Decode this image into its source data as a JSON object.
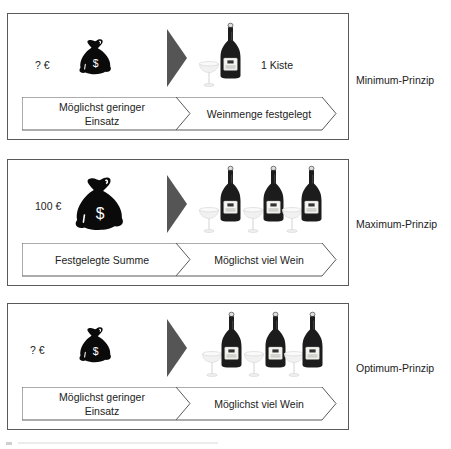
{
  "panels": [
    {
      "amount": "? €",
      "bag_size": "small",
      "bottle_count": 1,
      "quantity_label": "1 Kiste",
      "step1": "Möglichst geringer Einsatz",
      "step1_line1": "Möglichst geringer",
      "step1_line2": "Einsatz",
      "step2": "Weinmenge festgelegt",
      "principle": "Minimum-Prinzip"
    },
    {
      "amount": "100 €",
      "bag_size": "large",
      "bottle_count": 3,
      "quantity_label": "",
      "step1": "Festgelegte Summe",
      "step1_line1": "Festgelegte Summe",
      "step1_line2": "",
      "step2": "Möglichst viel Wein",
      "principle": "Maximum-Prinzip"
    },
    {
      "amount": "? €",
      "bag_size": "small",
      "bottle_count": 3,
      "quantity_label": "",
      "step1": "Möglichst geringer Einsatz",
      "step1_line1": "Möglichst geringer",
      "step1_line2": "Einsatz",
      "step2": "Möglichst viel Wein",
      "principle": "Optimum-Prinzip"
    }
  ],
  "icons": {
    "money_bag": "money-bag-dollar-icon",
    "arrow": "triangle-right-icon",
    "bottle": "wine-bottle-icon",
    "glass": "champagne-glass-icon"
  },
  "colors": {
    "border": "#5a5a5a",
    "triangle": "#555555",
    "bag": "#0a0a0a",
    "bottle": "#1c1c1c",
    "glass": "#e6e6e6"
  }
}
